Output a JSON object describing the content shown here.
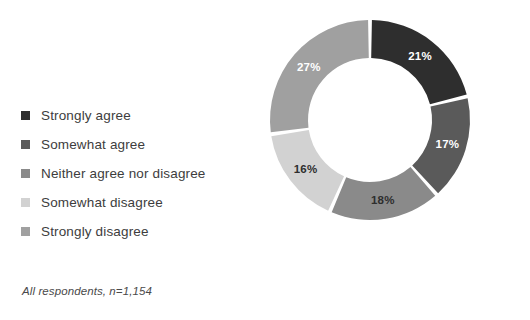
{
  "title_remnant": "",
  "footnote": "All respondents, n=1,154",
  "legend": {
    "items": [
      {
        "label": "Strongly agree",
        "color": "#2e2e2e"
      },
      {
        "label": "Somewhat agree",
        "color": "#5a5a5a"
      },
      {
        "label": "Neither agree nor disagree",
        "color": "#8a8a8a"
      },
      {
        "label": "Somewhat disagree",
        "color": "#d2d2d2"
      },
      {
        "label": "Strongly disagree",
        "color": "#a0a0a0"
      }
    ]
  },
  "chart_data": {
    "type": "pie",
    "variant": "donut",
    "title": "",
    "xlabel": "",
    "ylabel": "",
    "units": "%",
    "start_angle_deg": 0,
    "direction": "clockwise",
    "gap_deg": 2.2,
    "inner_radius_ratio": 0.62,
    "legend_position": "left",
    "grid": false,
    "total": 99,
    "sample_size": "n=1,154",
    "categories": [
      "Strongly agree",
      "Somewhat agree",
      "Neither agree nor disagree",
      "Somewhat disagree",
      "Strongly disagree"
    ],
    "values": [
      21,
      17,
      18,
      16,
      27
    ],
    "labels": [
      "21%",
      "17%",
      "18%",
      "16%",
      "27%"
    ],
    "colors": [
      "#2e2e2e",
      "#5a5a5a",
      "#8a8a8a",
      "#d2d2d2",
      "#a0a0a0"
    ],
    "label_colors": [
      "#ffffff",
      "#ffffff",
      "#2e2e2e",
      "#2e2e2e",
      "#ffffff"
    ]
  }
}
